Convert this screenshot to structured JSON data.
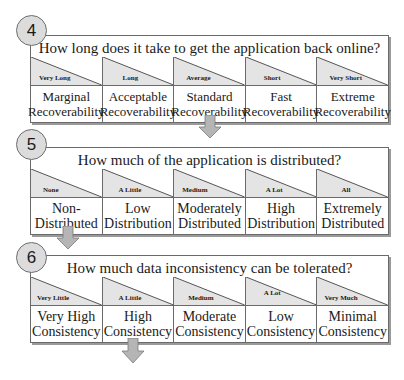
{
  "panels": [
    {
      "number": "4",
      "question": "How long does it take to get the application back online?",
      "columns": [
        {
          "level": "Very Long",
          "label": "Marginal Recoverability"
        },
        {
          "level": "Long",
          "label": "Acceptable Recoverability"
        },
        {
          "level": "Average",
          "label": "Standard Recoverability"
        },
        {
          "level": "Short",
          "label": "Fast Recoverability"
        },
        {
          "level": "Very Short",
          "label": "Extreme Recoverability"
        }
      ]
    },
    {
      "number": "5",
      "question": "How much of the application is distributed?",
      "columns": [
        {
          "level": "None",
          "label": "Non-Distributed"
        },
        {
          "level": "A Little",
          "label": "Low Distribution"
        },
        {
          "level": "Medium",
          "label": "Moderately Distributed"
        },
        {
          "level": "A Lot",
          "label": "High Distribution"
        },
        {
          "level": "All",
          "label": "Extremely Distributed"
        }
      ]
    },
    {
      "number": "6",
      "question": "How much data inconsistency can be tolerated?",
      "columns": [
        {
          "level": "Very Little",
          "label": "Very High Consistency"
        },
        {
          "level": "A Little",
          "label": "High Consistency"
        },
        {
          "level": "Medium",
          "label": "Moderate Consistency"
        },
        {
          "level": "A Lot",
          "label": "Low Consistency"
        },
        {
          "level": "Very Much",
          "label": "Minimal Consistency"
        }
      ]
    }
  ],
  "colors": {
    "triangle_fill": "#e4e4e4",
    "circle_fill": "#dcdcdc",
    "arrow_fill": "#b5b5b5",
    "border": "#6a6a6a"
  }
}
